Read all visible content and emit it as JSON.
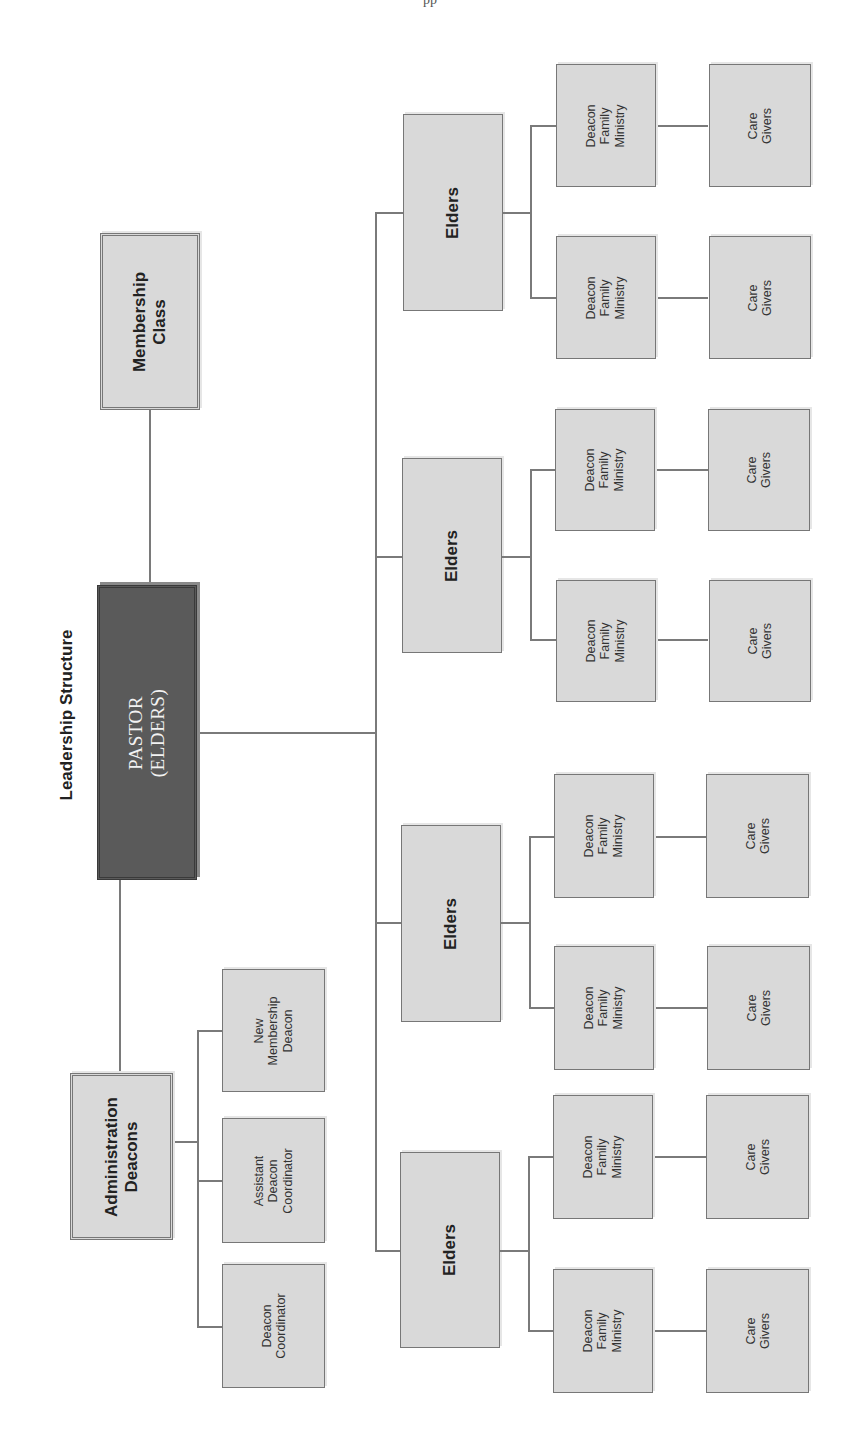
{
  "page": {
    "header_fragment": "pp"
  },
  "diagram": {
    "title": "Leadership Structure",
    "pastor": {
      "line1": "PASTOR",
      "line2": "(ELDERS)"
    },
    "membership_class": {
      "line1": "Membership",
      "line2": "Class"
    },
    "administration": {
      "label": {
        "line1": "Administration",
        "line2": "Deacons"
      },
      "children": [
        {
          "lines": [
            "New",
            "Membership",
            "Deacon"
          ]
        },
        {
          "lines": [
            "Assistant",
            "Deacon",
            "Coordinator"
          ]
        },
        {
          "lines": [
            "Deacon",
            "Coordinator"
          ]
        }
      ]
    },
    "elders_groups": [
      {
        "label": "Elders",
        "ministries": [
          {
            "dfm": [
              "Deacon",
              "Family",
              "Ministry"
            ],
            "care": [
              "Care",
              "Givers"
            ]
          },
          {
            "dfm": [
              "Deacon",
              "Family",
              "Ministry"
            ],
            "care": [
              "Care",
              "Givers"
            ]
          }
        ]
      },
      {
        "label": "Elders",
        "ministries": [
          {
            "dfm": [
              "Deacon",
              "Family",
              "Ministry"
            ],
            "care": [
              "Care",
              "Givers"
            ]
          },
          {
            "dfm": [
              "Deacon",
              "Family",
              "Ministry"
            ],
            "care": [
              "Care",
              "Givers"
            ]
          }
        ]
      },
      {
        "label": "Elders",
        "ministries": [
          {
            "dfm": [
              "Deacon",
              "Family",
              "Ministry"
            ],
            "care": [
              "Care",
              "Givers"
            ]
          },
          {
            "dfm": [
              "Deacon",
              "Family",
              "Ministry"
            ],
            "care": [
              "Care",
              "Givers"
            ]
          }
        ]
      },
      {
        "label": "Elders",
        "ministries": [
          {
            "dfm": [
              "Deacon",
              "Family",
              "Ministry"
            ],
            "care": [
              "Care",
              "Givers"
            ]
          },
          {
            "dfm": [
              "Deacon",
              "Family",
              "Ministry"
            ],
            "care": [
              "Care",
              "Givers"
            ]
          }
        ]
      }
    ],
    "colors": {
      "box_fill": "#d9d9d9",
      "pastor_fill": "#5a5a5a",
      "line": "#7a7a7a",
      "text": "#222222"
    }
  }
}
